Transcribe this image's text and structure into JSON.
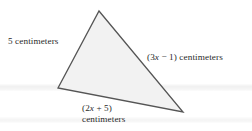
{
  "figure": {
    "kind": "geometry-diagram",
    "shape": "triangle",
    "background_color": "#ffffff",
    "fill_color": "#f2f2f2",
    "stroke_color": "#555555",
    "text_color": "#2a2a2a",
    "vertices": {
      "apex": [
        99,
        11
      ],
      "left": [
        58,
        88
      ],
      "right": [
        183,
        112
      ]
    },
    "labels": {
      "left_side": "5 centimeters",
      "right_side_prefix": "(3",
      "right_side_var": "x",
      "right_side_suffix": " − 1) centimeters",
      "right_side_full": "(3x − 1) centimeters",
      "bottom_side_prefix": "(2",
      "bottom_side_var": "x",
      "bottom_side_suffix": " + 5)",
      "bottom_side_expression": "(2x + 5)",
      "bottom_side_unit": "centimeters"
    }
  }
}
